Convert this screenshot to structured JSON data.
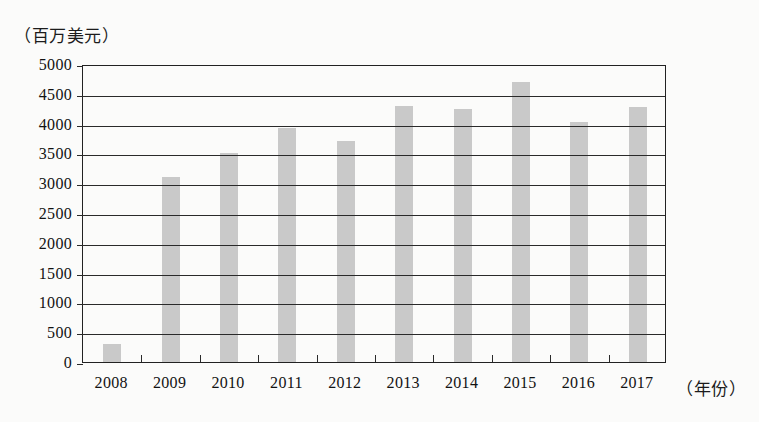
{
  "chart_data": {
    "type": "bar",
    "title": "",
    "subtitle": "",
    "xlabel": "（年份）",
    "ylabel": "（百万美元）",
    "categories": [
      "2008",
      "2009",
      "2010",
      "2011",
      "2012",
      "2013",
      "2014",
      "2015",
      "2016",
      "2017"
    ],
    "values": [
      300,
      3100,
      3500,
      3930,
      3700,
      4300,
      4250,
      4700,
      4030,
      4280
    ],
    "ylim": [
      0,
      5000
    ],
    "yticks": [
      "0",
      "500",
      "1000",
      "1500",
      "2000",
      "2500",
      "3000",
      "3500",
      "4000",
      "4500",
      "5000"
    ],
    "ytick_values": [
      0,
      500,
      1000,
      1500,
      2000,
      2500,
      3000,
      3500,
      4000,
      4500,
      5000
    ],
    "grid": true,
    "legend": false,
    "legend_position": "none",
    "bar_color": "#c9c9c9",
    "axis_color": "#2a2a2a",
    "background_color": "#fbfbfa"
  }
}
